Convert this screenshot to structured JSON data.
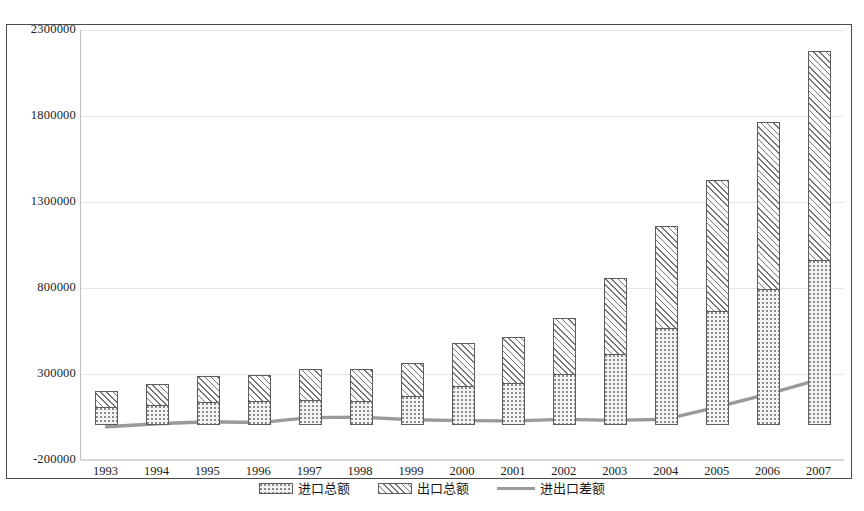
{
  "chart_data": {
    "type": "bar",
    "title": "",
    "subtitle": "",
    "xlabel": "",
    "ylabel": "",
    "categories": [
      "1993",
      "1994",
      "1995",
      "1996",
      "1997",
      "1998",
      "1999",
      "2000",
      "2001",
      "2002",
      "2003",
      "2004",
      "2005",
      "2006",
      "2007"
    ],
    "ylim": [
      -200000,
      2300000
    ],
    "yticks": [
      -200000,
      300000,
      800000,
      1300000,
      1800000,
      2300000
    ],
    "ytick_labels": [
      "-200000",
      "300000",
      "800000",
      "1300000",
      "1800000",
      "2300000"
    ],
    "grid": true,
    "legend_position": "bottom",
    "stacked": true,
    "series": [
      {
        "name": "进口总额",
        "type": "bar",
        "fill": "dotted",
        "values": [
          104000,
          116000,
          132000,
          139000,
          142000,
          140000,
          166000,
          225000,
          244000,
          295000,
          413000,
          561000,
          660000,
          791000,
          956000
        ]
      },
      {
        "name": "出口总额",
        "type": "bar",
        "fill": "diagonal-hatch",
        "values": [
          92000,
          121000,
          149000,
          151000,
          183000,
          184000,
          195000,
          249000,
          266000,
          326000,
          438000,
          593000,
          762000,
          969000,
          1218000
        ]
      },
      {
        "name": "进出口差额",
        "type": "line",
        "color": "#9a9a9a",
        "values": [
          -12000,
          5000,
          17000,
          12000,
          41000,
          44000,
          29000,
          24000,
          22000,
          31000,
          25000,
          32000,
          102000,
          178000,
          262000
        ]
      }
    ],
    "totals": [
      196000,
      237000,
      281000,
      290000,
      325000,
      324000,
      361000,
      474000,
      510000,
      621000,
      851000,
      1154000,
      1422000,
      1760000,
      2174000
    ]
  },
  "axis": {
    "y_tick_labels": [
      "2300000",
      "1800000",
      "1300000",
      "800000",
      "300000",
      "-200000"
    ],
    "x_tick_labels": [
      "1993",
      "1994",
      "1995",
      "1996",
      "1997",
      "1998",
      "1999",
      "2000",
      "2001",
      "2002",
      "2003",
      "2004",
      "2005",
      "2006",
      "2007"
    ]
  },
  "legend": {
    "items": [
      {
        "label": "进口总额",
        "swatch": "dotted-bar-swatch"
      },
      {
        "label": "出口总额",
        "swatch": "hatched-bar-swatch"
      },
      {
        "label": "进出口差额",
        "swatch": "gray-line-swatch"
      }
    ]
  },
  "colors": {
    "frame": "#4a4a4a",
    "grid": "#e6e6e6",
    "bar_outline": "#5d5d5d",
    "line": "#9a9a9a",
    "text": "#1c1c1c"
  }
}
